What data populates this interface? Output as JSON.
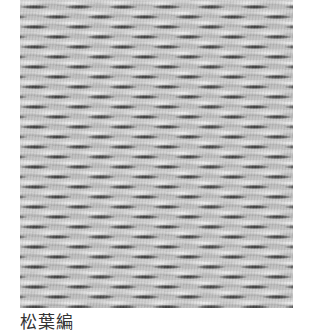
{
  "figure": {
    "image": {
      "subject": "woven-texture-photo",
      "description": "Close-up grayscale photograph of a pine-needle (matsuba) weave pattern",
      "tone": "grayscale"
    },
    "caption": "松葉編"
  },
  "colors": {
    "background": "#ffffff",
    "caption_text": "#333333",
    "weave_base": "#c4c4c4"
  }
}
